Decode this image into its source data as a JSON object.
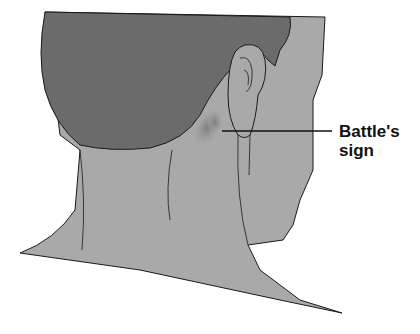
{
  "figure": {
    "annotation": {
      "line1": "Battle's",
      "line2": "sign"
    },
    "colors": {
      "hair": "#6b6b6b",
      "skin": "#a9a9a9",
      "bruise": "#7d7d7d",
      "outline": "#1a1a1a",
      "background": "#ffffff"
    }
  }
}
